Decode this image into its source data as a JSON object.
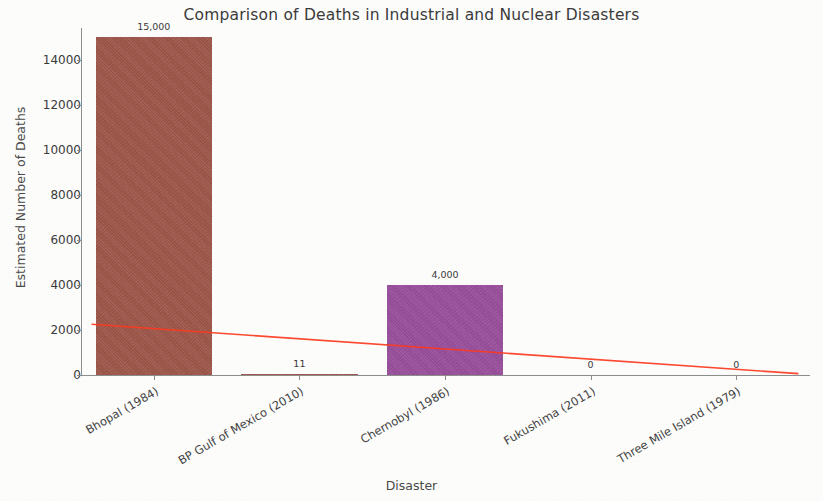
{
  "chart_data": {
    "type": "bar",
    "title": "Comparison of Deaths in Industrial and Nuclear Disasters",
    "xlabel": "Disaster",
    "ylabel": "Estimated Number of Deaths",
    "categories": [
      "Bhopal (1984)",
      "BP Gulf of Mexico (2010)",
      "Chernobyl (1986)",
      "Fukushima (2011)",
      "Three Mile Island (1979)"
    ],
    "values": [
      15000,
      11,
      4000,
      0,
      0
    ],
    "value_labels": [
      "15,000",
      "11",
      "4,000",
      "0",
      "0"
    ],
    "bar_colors": [
      "#a0574a",
      "#a0574a",
      "#9b4f9e",
      "#a0574a",
      "#a0574a"
    ],
    "ylim": [
      0,
      15400
    ],
    "yticks": [
      0,
      2000,
      4000,
      6000,
      8000,
      10000,
      12000,
      14000
    ],
    "ytick_labels": [
      "0",
      "2000",
      "4000",
      "6000",
      "8000",
      "10000",
      "12000",
      "14000"
    ],
    "grid": false,
    "legend": null,
    "annotations": [
      {
        "name": "trend-line",
        "type": "line",
        "color": "#ff3b20",
        "from": [
          0,
          2250
        ],
        "to": [
          4,
          60
        ],
        "description": "declining red trend line across bars"
      }
    ]
  },
  "axes": {
    "y_title": "Estimated Number of Deaths",
    "x_title": "Disaster"
  }
}
